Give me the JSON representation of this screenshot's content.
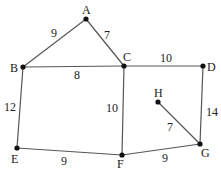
{
  "diagram": {
    "type": "weighted-graph",
    "nodes": [
      {
        "id": "A",
        "label": "A",
        "x": 86,
        "y": 19,
        "lx": 82,
        "ly": 14
      },
      {
        "id": "B",
        "label": "B",
        "x": 23,
        "y": 67,
        "lx": 10,
        "ly": 72
      },
      {
        "id": "C",
        "label": "C",
        "x": 124,
        "y": 66,
        "lx": 123,
        "ly": 61
      },
      {
        "id": "D",
        "label": "D",
        "x": 203,
        "y": 66,
        "lx": 207,
        "ly": 71
      },
      {
        "id": "E",
        "label": "E",
        "x": 17,
        "y": 148,
        "lx": 11,
        "ly": 163
      },
      {
        "id": "F",
        "label": "F",
        "x": 122,
        "y": 155,
        "lx": 117,
        "ly": 168
      },
      {
        "id": "G",
        "label": "G",
        "x": 200,
        "y": 144,
        "lx": 201,
        "ly": 157
      },
      {
        "id": "H",
        "label": "H",
        "x": 158,
        "y": 102,
        "lx": 154,
        "ly": 97
      }
    ],
    "edges": [
      {
        "from": "A",
        "to": "B",
        "weight": "9",
        "lx": 51,
        "ly": 37
      },
      {
        "from": "A",
        "to": "C",
        "weight": "7",
        "lx": 104,
        "ly": 39
      },
      {
        "from": "B",
        "to": "C",
        "weight": "8",
        "lx": 74,
        "ly": 79
      },
      {
        "from": "C",
        "to": "D",
        "weight": "10",
        "lx": 160,
        "ly": 62
      },
      {
        "from": "B",
        "to": "E",
        "weight": "12",
        "lx": 4,
        "ly": 111
      },
      {
        "from": "C",
        "to": "F",
        "weight": "10",
        "lx": 106,
        "ly": 112
      },
      {
        "from": "D",
        "to": "G",
        "weight": "14",
        "lx": 206,
        "ly": 116
      },
      {
        "from": "H",
        "to": "G",
        "weight": "7",
        "lx": 167,
        "ly": 131
      },
      {
        "from": "E",
        "to": "F",
        "weight": "9",
        "lx": 61,
        "ly": 165
      },
      {
        "from": "F",
        "to": "G",
        "weight": "9",
        "lx": 162,
        "ly": 162
      }
    ]
  }
}
